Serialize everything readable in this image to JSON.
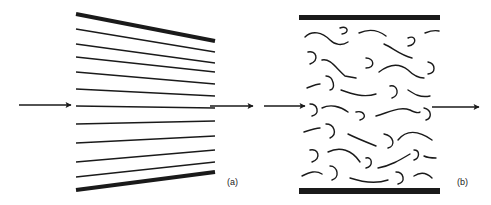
{
  "figure": {
    "panel_a": {
      "label": "(a)",
      "description": "Converging streamlines between tapered walls (laminar / ordered flow)",
      "walls": {
        "top": {
          "x1": 76,
          "y1": 14,
          "x2": 215,
          "y2": 41
        },
        "bottom": {
          "x1": 76,
          "y1": 190,
          "x2": 215,
          "y2": 172
        }
      },
      "streamlines": [
        {
          "y_left": 29,
          "y_right": 52
        },
        {
          "y_left": 44,
          "y_right": 63
        },
        {
          "y_left": 57,
          "y_right": 72
        },
        {
          "y_left": 72,
          "y_right": 84
        },
        {
          "y_left": 89,
          "y_right": 96
        },
        {
          "y_left": 106,
          "y_right": 108
        },
        {
          "y_left": 124,
          "y_right": 121
        },
        {
          "y_left": 143,
          "y_right": 136
        },
        {
          "y_left": 162,
          "y_right": 150
        },
        {
          "y_left": 177,
          "y_right": 162
        }
      ],
      "arrow_in": {
        "x1": 19,
        "x2": 71,
        "y": 105
      },
      "arrow_out": {
        "x1": 210,
        "x2": 253,
        "y": 106
      }
    },
    "panel_b": {
      "label": "(b)",
      "description": "Parallel walls with randomly oriented curly fragments (disordered / turbulent flow)",
      "walls": {
        "top": {
          "x1": 299,
          "x2": 440,
          "y": 17
        },
        "bottom": {
          "x1": 299,
          "x2": 440,
          "y": 191
        }
      },
      "arrow_in": {
        "x1": 264,
        "x2": 305,
        "y": 106
      },
      "arrow_out": {
        "x1": 432,
        "x2": 479,
        "y": 107
      }
    },
    "colors": {
      "stroke": "#1a1a1a",
      "background": "#ffffff"
    }
  }
}
